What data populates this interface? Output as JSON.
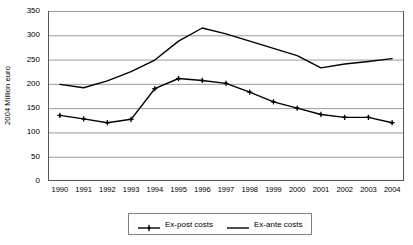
{
  "chart_data": {
    "type": "line",
    "title": "",
    "xlabel": "",
    "ylabel": "2004 Million euro",
    "ylim": [
      0,
      350
    ],
    "ytick_step": 50,
    "yticks": [
      350,
      300,
      250,
      200,
      150,
      100,
      50,
      0
    ],
    "grid": true,
    "legend_position": "bottom",
    "categories": [
      "1990",
      "1991",
      "1992",
      "1993",
      "1994",
      "1995",
      "1996",
      "1997",
      "1998",
      "1999",
      "2000",
      "2001",
      "2002",
      "2003",
      "2004"
    ],
    "series": [
      {
        "name": "Ex-post costs",
        "color": "#000000",
        "marker": "plus-dot",
        "values": [
          135,
          128,
          120,
          127,
          190,
          211,
          207,
          201,
          183,
          163,
          150,
          137,
          131,
          131,
          120
        ]
      },
      {
        "name": "Ex-ante costs",
        "color": "#000000",
        "marker": "none",
        "values": [
          199,
          192,
          206,
          225,
          249,
          288,
          315,
          303,
          288,
          273,
          258,
          233,
          241,
          246,
          252
        ]
      }
    ]
  },
  "legend": {
    "entries": [
      {
        "label": "Ex-post costs",
        "marker": "plus-dot"
      },
      {
        "label": "Ex-ante costs",
        "marker": "none"
      }
    ]
  },
  "colors": {
    "series_line": "#000000",
    "gridline": "#9a9a9a",
    "axis": "#555555",
    "background": "#ffffff",
    "legend_border": "#808080"
  }
}
